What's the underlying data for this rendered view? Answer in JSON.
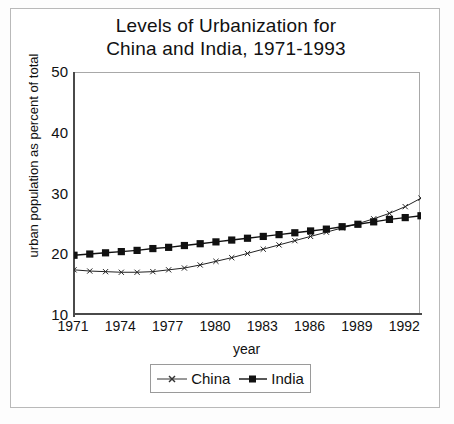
{
  "chart_data": {
    "type": "line",
    "title": "Levels of Urbanization for China and India, 1971-1993",
    "title_lines": [
      "Levels of Urbanization for",
      "China and India, 1971-1993"
    ],
    "xlabel": "year",
    "ylabel": "urban population as percent of total",
    "xlim": [
      1971,
      1993
    ],
    "ylim": [
      10,
      50
    ],
    "ytick_labels": [
      "50",
      "40",
      "30",
      "20",
      "10"
    ],
    "yticks": [
      50,
      40,
      30,
      20,
      10
    ],
    "xtick_labels": [
      "1971",
      "1974",
      "1977",
      "1980",
      "1983",
      "1986",
      "1989",
      "1992"
    ],
    "xticks": [
      1971,
      1974,
      1977,
      1980,
      1983,
      1986,
      1989,
      1992
    ],
    "grid": false,
    "legend_position": "below-axes",
    "x": [
      1971,
      1972,
      1973,
      1974,
      1975,
      1976,
      1977,
      1978,
      1979,
      1980,
      1981,
      1982,
      1983,
      1984,
      1985,
      1986,
      1987,
      1988,
      1989,
      1990,
      1991,
      1992,
      1993
    ],
    "series": [
      {
        "name": "China",
        "marker": "cross-tick",
        "color": "#222222",
        "values": [
          17.6,
          17.4,
          17.3,
          17.2,
          17.2,
          17.3,
          17.6,
          17.9,
          18.4,
          19.0,
          19.6,
          20.3,
          21.0,
          21.7,
          22.4,
          23.1,
          23.8,
          24.5,
          25.2,
          26.0,
          26.9,
          28.0,
          29.4
        ]
      },
      {
        "name": "India",
        "marker": "filled-square",
        "color": "#111111",
        "values": [
          20.0,
          20.2,
          20.4,
          20.6,
          20.8,
          21.1,
          21.3,
          21.6,
          21.9,
          22.2,
          22.5,
          22.8,
          23.1,
          23.4,
          23.7,
          24.0,
          24.3,
          24.7,
          25.1,
          25.5,
          25.9,
          26.2,
          26.5
        ]
      }
    ]
  },
  "legend": {
    "entries": [
      {
        "label": "China"
      },
      {
        "label": "India"
      }
    ]
  }
}
